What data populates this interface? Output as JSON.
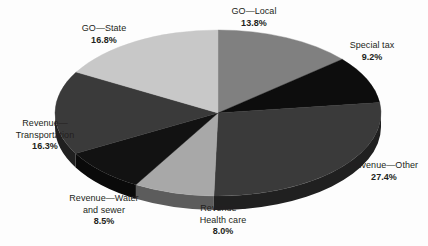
{
  "chart_data": {
    "type": "pie",
    "title": "",
    "subtitle": "",
    "xlabel": "",
    "ylabel": "",
    "legend_position": "none",
    "grid": false,
    "three_d": true,
    "labels_show_percent": true,
    "categories": [
      "GO—Local",
      "Special tax",
      "Revenue—Other",
      "Revenue—Health care",
      "Revenue—Water and sewer",
      "Revenue—Transportation",
      "GO—State"
    ],
    "values": [
      13.8,
      9.2,
      27.4,
      8.0,
      8.5,
      16.3,
      16.8
    ],
    "value_labels": [
      "13.8%",
      "9.2%",
      "27.4%",
      "8.0%",
      "8.5%",
      "16.3%",
      "16.8%"
    ],
    "colors": [
      "#808080",
      "#0d0d0d",
      "#3a3a3a",
      "#a8a8a8",
      "#121212",
      "#3a3a3a",
      "#c8c8c8"
    ],
    "slices": [
      {
        "name": "GO—Local",
        "name_lines": [
          "GO—Local"
        ],
        "value": 13.8,
        "value_label": "13.8%",
        "color": "#808080"
      },
      {
        "name": "Special tax",
        "name_lines": [
          "Special tax"
        ],
        "value": 9.2,
        "value_label": "9.2%",
        "color": "#0d0d0d"
      },
      {
        "name": "Revenue—Other",
        "name_lines": [
          "Revenue—Other"
        ],
        "value": 27.4,
        "value_label": "27.4%",
        "color": "#3a3a3a"
      },
      {
        "name": "Revenue—Health care",
        "name_lines": [
          "Revenue—",
          "Health care"
        ],
        "value": 8.0,
        "value_label": "8.0%",
        "color": "#a8a8a8"
      },
      {
        "name": "Revenue—Water and sewer",
        "name_lines": [
          "Revenue—Water",
          "and sewer"
        ],
        "value": 8.5,
        "value_label": "8.5%",
        "color": "#121212"
      },
      {
        "name": "Revenue—Transportation",
        "name_lines": [
          "Revenue—",
          "Transportation"
        ],
        "value": 16.3,
        "value_label": "16.3%",
        "color": "#3a3a3a"
      },
      {
        "name": "GO—State",
        "name_lines": [
          "GO—State"
        ],
        "value": 16.8,
        "value_label": "16.8%",
        "color": "#c8c8c8"
      }
    ]
  },
  "labels": {
    "go_local": {
      "line1": "GO—Local",
      "value": "13.8%"
    },
    "special_tax": {
      "line1": "Special tax",
      "value": "9.2%"
    },
    "revenue_other": {
      "line1": "Revenue—Other",
      "value": "27.4%"
    },
    "revenue_health": {
      "line1": "Revenue—",
      "line2": "Health care",
      "value": "8.0%"
    },
    "revenue_water": {
      "line1": "Revenue—Water",
      "line2": "and sewer",
      "value": "8.5%"
    },
    "revenue_transport": {
      "line1": "Revenue—",
      "line2": "Transportation",
      "value": "16.3%"
    },
    "go_state": {
      "line1": "GO—State",
      "value": "16.8%"
    }
  },
  "geometry": {
    "cx": 218,
    "cy": 113,
    "rx": 163,
    "ry": 83,
    "depth": 14,
    "start_angle_deg": -90
  },
  "style": {
    "background": "#fdfdfd",
    "text_color": "#231f20"
  }
}
